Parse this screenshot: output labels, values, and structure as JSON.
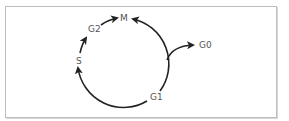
{
  "diagram": {
    "type": "cell-cycle",
    "phases": [
      {
        "id": "M",
        "label": "M"
      },
      {
        "id": "G1",
        "label": "G1"
      },
      {
        "id": "S",
        "label": "S"
      },
      {
        "id": "G2",
        "label": "G2"
      },
      {
        "id": "G0",
        "label": "G0"
      }
    ],
    "edges": [
      {
        "from": "M",
        "to": "G1",
        "direction": "clockwise-arc-via-right"
      },
      {
        "from": "G1",
        "to": "S",
        "direction": "arc-via-bottom"
      },
      {
        "from": "S",
        "to": "G2"
      },
      {
        "from": "G2",
        "to": "M"
      },
      {
        "from": "cycle",
        "to": "G0",
        "branch": "exit-right"
      }
    ],
    "colors": {
      "stroke": "#222222",
      "label": "#555555",
      "border": "#bdbdbd"
    }
  }
}
